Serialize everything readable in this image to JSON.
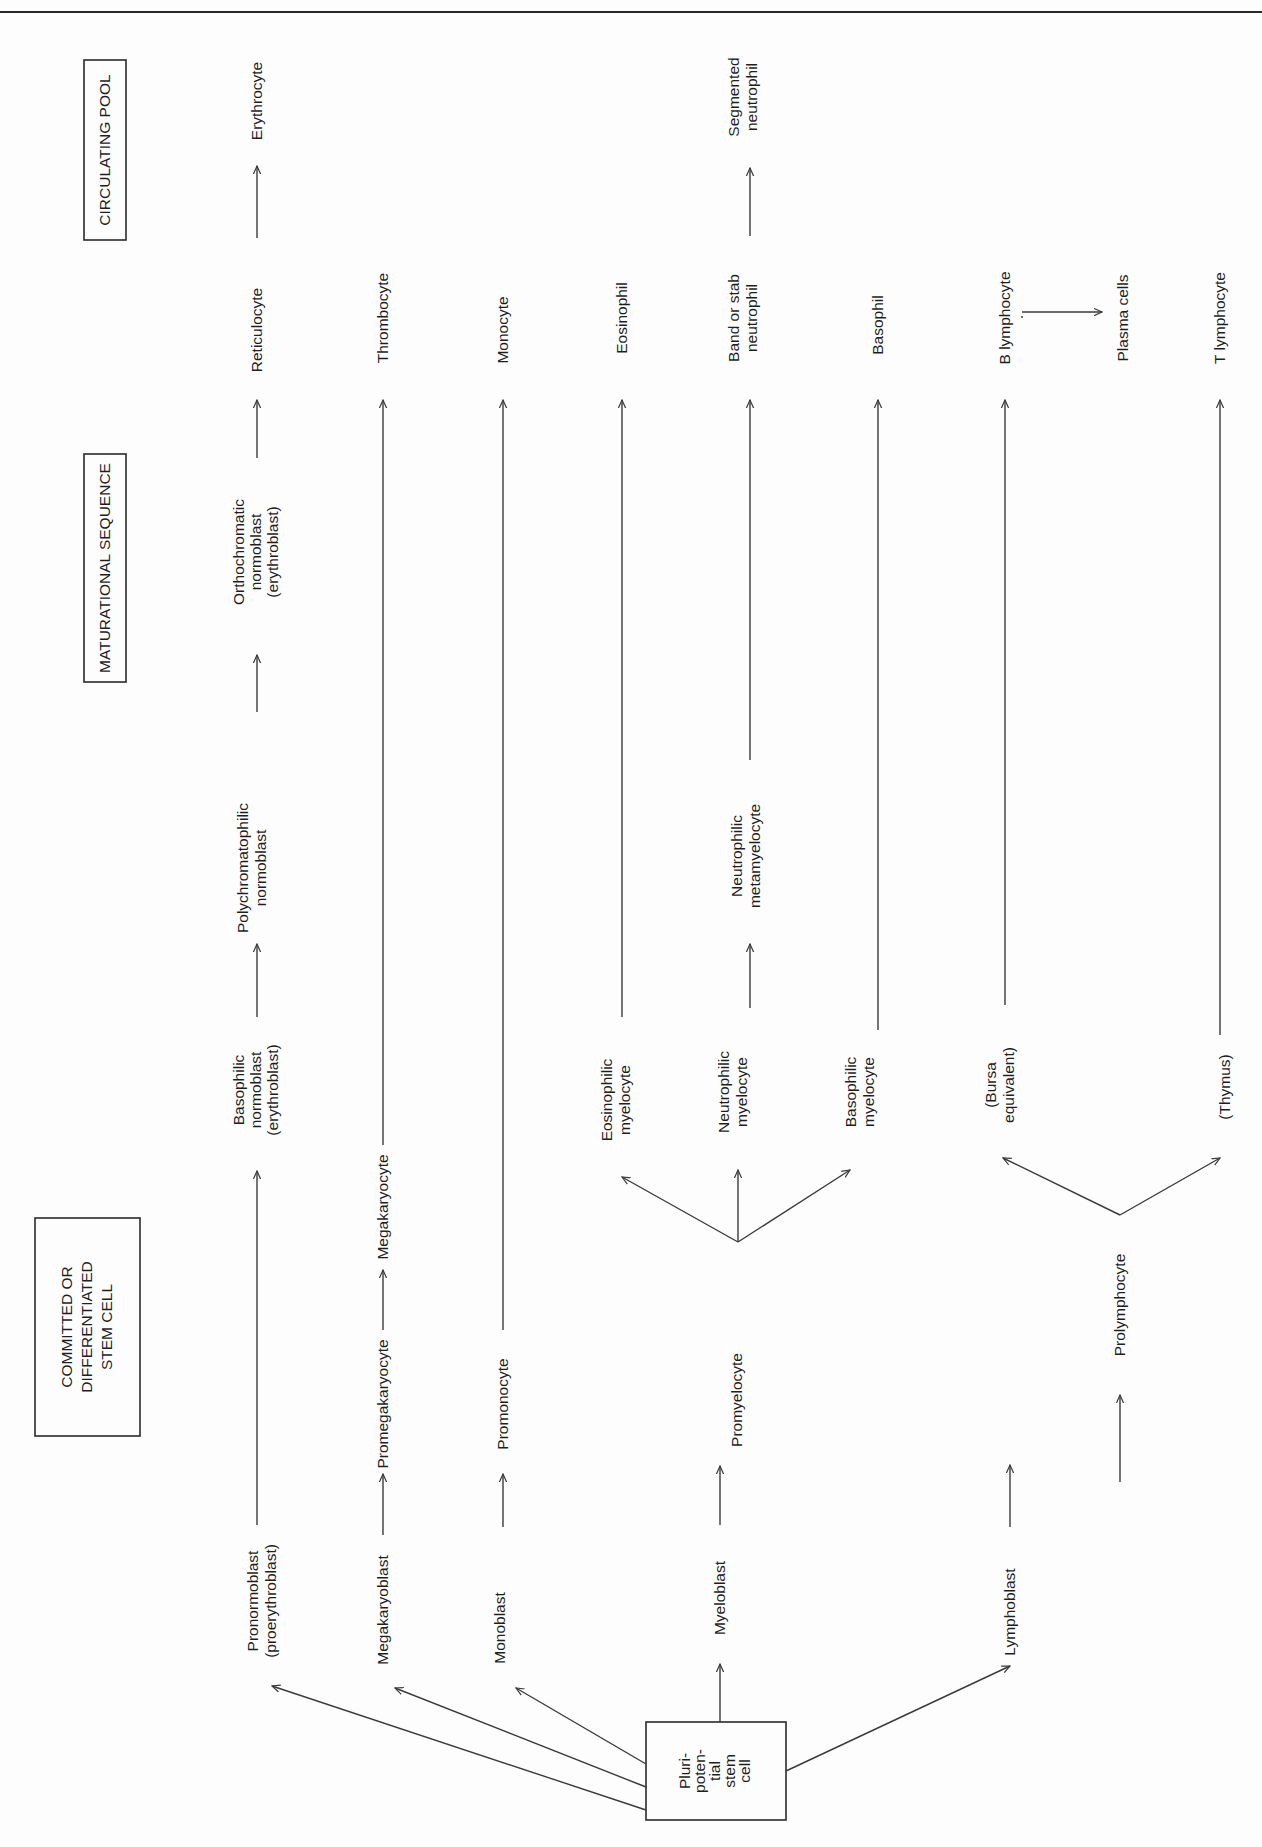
{
  "diagram": {
    "orientation": "rotated 90° counter-clockwise; flow runs from bottom (stem cell) to top (circulating pool)",
    "headers": {
      "committed": [
        "COMMITTED OR",
        "DIFFERENTIATED",
        "STEM CELL"
      ],
      "maturational": "MATURATIONAL SEQUENCE",
      "circulating": "CIRCULATING POOL"
    },
    "root": {
      "label_lines": [
        "Pluri-",
        "poten-",
        "tial",
        "stem",
        "cell"
      ]
    },
    "lineages": [
      {
        "name": "erythroid",
        "stages": [
          {
            "id": "pronormoblast",
            "lines": [
              "Pronormoblast",
              "(proerythroblast)"
            ]
          },
          {
            "id": "basophilic-normoblast",
            "lines": [
              "Basophilic",
              "normoblast",
              "(erythroblast)"
            ]
          },
          {
            "id": "polychromatophilic-normoblast",
            "lines": [
              "Polychromatophilic",
              "normoblast"
            ]
          },
          {
            "id": "orthochromatic-normoblast",
            "lines": [
              "Orthochromatic",
              "normoblast",
              "(erythroblast)"
            ]
          },
          {
            "id": "reticulocyte",
            "lines": [
              "Reticulocyte"
            ]
          },
          {
            "id": "erythrocyte",
            "lines": [
              "Erythrocyte"
            ]
          }
        ]
      },
      {
        "name": "megakaryocytic",
        "stages": [
          {
            "id": "megakaryoblast",
            "lines": [
              "Megakaryoblast"
            ]
          },
          {
            "id": "promegakaryocyte",
            "lines": [
              "Promegakaryocyte"
            ]
          },
          {
            "id": "megakaryocyte",
            "lines": [
              "Megakaryocyte"
            ]
          },
          {
            "id": "thrombocyte",
            "lines": [
              "Thrombocyte"
            ]
          }
        ]
      },
      {
        "name": "monocytic",
        "stages": [
          {
            "id": "monoblast",
            "lines": [
              "Monoblast"
            ]
          },
          {
            "id": "promonocyte",
            "lines": [
              "Promonocyte"
            ]
          },
          {
            "id": "monocyte",
            "lines": [
              "Monocyte"
            ]
          }
        ]
      },
      {
        "name": "granulocytic",
        "stages": [
          {
            "id": "myeloblast",
            "lines": [
              "Myeloblast"
            ]
          },
          {
            "id": "promyelocyte",
            "lines": [
              "Promyelocyte"
            ]
          },
          {
            "id": "eosinophilic-myelocyte",
            "lines": [
              "Eosinophilic",
              "myelocyte"
            ]
          },
          {
            "id": "eosinophil",
            "lines": [
              "Eosinophil"
            ]
          },
          {
            "id": "neutrophilic-myelocyte",
            "lines": [
              "Neutrophilic",
              "myelocyte"
            ]
          },
          {
            "id": "neutrophilic-metamyelocyte",
            "lines": [
              "Neutrophilic",
              "metamyelocyte"
            ]
          },
          {
            "id": "band-neutrophil",
            "lines": [
              "Band or stab",
              "neutrophil"
            ]
          },
          {
            "id": "segmented-neutrophil",
            "lines": [
              "Segmented",
              "neutrophil"
            ]
          },
          {
            "id": "basophilic-myelocyte",
            "lines": [
              "Basophilic",
              "myelocyte"
            ]
          },
          {
            "id": "basophil",
            "lines": [
              "Basophil"
            ]
          }
        ]
      },
      {
        "name": "lymphoid",
        "stages": [
          {
            "id": "lymphoblast",
            "lines": [
              "Lymphoblast"
            ]
          },
          {
            "id": "prolymphocyte",
            "lines": [
              "Prolymphocyte"
            ]
          },
          {
            "id": "bursa-equivalent",
            "lines": [
              "(Bursa",
              "equivalent)"
            ]
          },
          {
            "id": "b-lymphocyte",
            "lines": [
              "B lymphocyte"
            ]
          },
          {
            "id": "plasma-cells",
            "lines": [
              "Plasma cells"
            ]
          },
          {
            "id": "thymus",
            "lines": [
              "(Thymus)"
            ]
          },
          {
            "id": "t-lymphocyte",
            "lines": [
              "T lymphocyte"
            ]
          }
        ]
      }
    ],
    "edges": [
      [
        "pluripotential-stem-cell",
        "pronormoblast"
      ],
      [
        "pluripotential-stem-cell",
        "megakaryoblast"
      ],
      [
        "pluripotential-stem-cell",
        "monoblast"
      ],
      [
        "pluripotential-stem-cell",
        "myeloblast"
      ],
      [
        "pluripotential-stem-cell",
        "lymphoblast"
      ],
      [
        "pronormoblast",
        "basophilic-normoblast"
      ],
      [
        "basophilic-normoblast",
        "polychromatophilic-normoblast"
      ],
      [
        "polychromatophilic-normoblast",
        "orthochromatic-normoblast"
      ],
      [
        "orthochromatic-normoblast",
        "reticulocyte"
      ],
      [
        "reticulocyte",
        "erythrocyte"
      ],
      [
        "megakaryoblast",
        "promegakaryocyte"
      ],
      [
        "promegakaryocyte",
        "megakaryocyte"
      ],
      [
        "megakaryocyte",
        "thrombocyte"
      ],
      [
        "monoblast",
        "promonocyte"
      ],
      [
        "promonocyte",
        "monocyte"
      ],
      [
        "myeloblast",
        "promyelocyte"
      ],
      [
        "promyelocyte",
        "eosinophilic-myelocyte"
      ],
      [
        "promyelocyte",
        "neutrophilic-myelocyte"
      ],
      [
        "promyelocyte",
        "basophilic-myelocyte"
      ],
      [
        "eosinophilic-myelocyte",
        "eosinophil"
      ],
      [
        "neutrophilic-myelocyte",
        "neutrophilic-metamyelocyte"
      ],
      [
        "neutrophilic-metamyelocyte",
        "band-neutrophil"
      ],
      [
        "band-neutrophil",
        "segmented-neutrophil"
      ],
      [
        "basophilic-myelocyte",
        "basophil"
      ],
      [
        "lymphoblast",
        "prolymphocyte"
      ],
      [
        "prolymphocyte",
        "bursa-equivalent"
      ],
      [
        "prolymphocyte",
        "thymus"
      ],
      [
        "bursa-equivalent",
        "b-lymphocyte"
      ],
      [
        "b-lymphocyte",
        "plasma-cells"
      ],
      [
        "thymus",
        "t-lymphocyte"
      ]
    ]
  },
  "labels": {
    "hdr_committed_1": "COMMITTED OR",
    "hdr_committed_2": "DIFFERENTIATED",
    "hdr_committed_3": "STEM CELL",
    "hdr_maturational": "MATURATIONAL SEQUENCE",
    "hdr_circulating": "CIRCULATING POOL",
    "stem_1": "Pluri-",
    "stem_2": "poten-",
    "stem_3": "tial",
    "stem_4": "stem",
    "stem_5": "cell",
    "pronormoblast_1": "Pronormoblast",
    "pronormoblast_2": "(proerythroblast)",
    "baso_norm_1": "Basophilic",
    "baso_norm_2": "normoblast",
    "baso_norm_3": "(erythroblast)",
    "poly_norm_1": "Polychromatophilic",
    "poly_norm_2": "normoblast",
    "ortho_norm_1": "Orthochromatic",
    "ortho_norm_2": "normoblast",
    "ortho_norm_3": "(erythroblast)",
    "reticulocyte": "Reticulocyte",
    "erythrocyte": "Erythrocyte",
    "megakaryoblast": "Megakaryoblast",
    "promegakaryocyte": "Promegakaryocyte",
    "megakaryocyte": "Megakaryocyte",
    "thrombocyte": "Thrombocyte",
    "monoblast": "Monoblast",
    "promonocyte": "Promonocyte",
    "monocyte": "Monocyte",
    "myeloblast": "Myeloblast",
    "promyelocyte": "Promyelocyte",
    "eos_myelo_1": "Eosinophilic",
    "eos_myelo_2": "myelocyte",
    "eosinophil": "Eosinophil",
    "neut_myelo_1": "Neutrophilic",
    "neut_myelo_2": "myelocyte",
    "neut_meta_1": "Neutrophilic",
    "neut_meta_2": "metamyelocyte",
    "band_1": "Band or stab",
    "band_2": "neutrophil",
    "seg_1": "Segmented",
    "seg_2": "neutrophil",
    "baso_myelo_1": "Basophilic",
    "baso_myelo_2": "myelocyte",
    "basophil": "Basophil",
    "lymphoblast": "Lymphoblast",
    "prolymphocyte": "Prolymphocyte",
    "bursa_1": "(Bursa",
    "bursa_2": "equivalent)",
    "b_lymphocyte": "B lymphocyte",
    "plasma_cells": "Plasma cells",
    "thymus": "(Thymus)",
    "t_lymphocyte": "T lymphocyte"
  }
}
